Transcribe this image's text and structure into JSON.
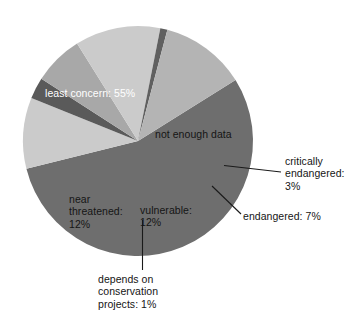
{
  "chart_data": {
    "type": "pie",
    "title": "",
    "subtitle": "",
    "xlabel": "",
    "ylabel": "",
    "legend_position": "none",
    "grid": false,
    "units": "percent",
    "total": 100,
    "categories": [
      "least concern",
      "not enough data",
      "critically endangered",
      "endangered",
      "vulnerable",
      "depends on conservation projects",
      "near threatened"
    ],
    "values": [
      55,
      10,
      3,
      7,
      12,
      1,
      12
    ],
    "slices": [
      {
        "name": "least-concern",
        "label": "least concern: 55%",
        "value": 55,
        "color": "#6e6e6e",
        "label_placement": "inside",
        "text_color": "#ffffff"
      },
      {
        "name": "not-enough-data",
        "label": "not enough data",
        "value": 10,
        "color": "#cbcbcb",
        "label_placement": "inside",
        "text_color": "#151515"
      },
      {
        "name": "critically-endangered",
        "label_lines": [
          "critically",
          "endangered:",
          "3%"
        ],
        "value": 3,
        "color": "#5a5a5a",
        "label_placement": "outside-leader",
        "text_color": "#151515"
      },
      {
        "name": "endangered",
        "label": "endangered: 7%",
        "value": 7,
        "color": "#a8a8a8",
        "label_placement": "outside-leader",
        "text_color": "#151515"
      },
      {
        "name": "vulnerable",
        "label_lines": [
          "vulnerable:",
          "12%"
        ],
        "value": 12,
        "color": "#cbcbcb",
        "label_placement": "inside",
        "text_color": "#151515"
      },
      {
        "name": "depends-on-conservation-projects",
        "label_lines": [
          "depends on",
          "conservation",
          "projects: 1%"
        ],
        "value": 1,
        "color": "#606060",
        "label_placement": "outside-leader",
        "text_color": "#151515"
      },
      {
        "name": "near-threatened",
        "label_lines": [
          "near",
          "threatened:",
          "12%"
        ],
        "value": 12,
        "color": "#b4b4b4",
        "label_placement": "inside",
        "text_color": "#151515"
      }
    ]
  },
  "labels": {
    "least_concern": "least concern: 55%",
    "not_enough_data": "not enough data",
    "critically_endangered_l1": "critically",
    "critically_endangered_l2": "endangered:",
    "critically_endangered_l3": "3%",
    "endangered": "endangered: 7%",
    "vulnerable_l1": "vulnerable:",
    "vulnerable_l2": "12%",
    "near_threatened_l1": "near",
    "near_threatened_l2": "threatened:",
    "near_threatened_l3": "12%",
    "depends_l1": "depends on",
    "depends_l2": "conservation",
    "depends_l3": "projects: 1%"
  },
  "colors": {
    "background": "#ffffff",
    "least_concern": "#6e6e6e",
    "not_enough_data": "#cbcbcb",
    "critically_endangered": "#5a5a5a",
    "endangered": "#a8a8a8",
    "vulnerable": "#cbcbcb",
    "depends_on_conservation": "#606060",
    "near_threatened": "#b4b4b4",
    "leader_line": "#1a1a1a",
    "text": "#151515",
    "text_inverse": "#ffffff"
  }
}
